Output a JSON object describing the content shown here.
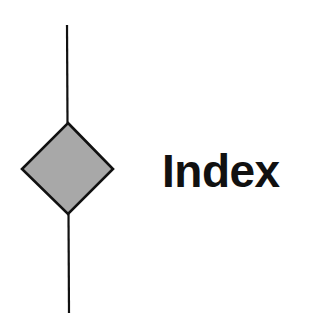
{
  "diagram": {
    "label": "Index",
    "shape": "decision-diamond",
    "colors": {
      "fill": "#a8a8a8",
      "stroke": "#111111",
      "text": "#111111",
      "background": "#ffffff"
    }
  }
}
